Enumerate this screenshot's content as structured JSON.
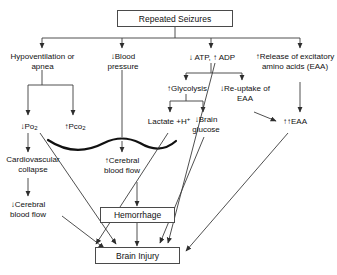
{
  "diagram": {
    "stroke_color": "#3c3c3c",
    "box_border_color": "#4a4a4a",
    "background": "#ffffff",
    "nodes": {
      "repeated_seizures": "Repeated Seizures",
      "hypoventilation": "Hypoventilation or apnea",
      "blood_pressure": "↓Blood pressure",
      "atp_adp": "↓ ATP, ↑ ADP",
      "release_eaa": "↑Release of excitatory amino acids (EAA)",
      "glycolysis": "↑Glycolysis",
      "reuptake_eaa": "↓Re-uptake of EAA",
      "po2": "↓Po",
      "po2_sub": "2",
      "pco2": "↑Pco",
      "pco2_sub": "2",
      "lactate": "Lactate +H",
      "lactate_sup": "+",
      "brain_glucose": "↓Brain glucose",
      "eaa_double": "↑↑EAA",
      "cardiovascular_collapse": "Cardiovascular collapse",
      "cerebral_blood_flow_up": "↑Cerebral blood flow",
      "cerebral_blood_flow_down": "↓Cerebral blood flow",
      "hemorrhage": "Hemorrhage",
      "brain_injury": "Brain Injury"
    }
  }
}
